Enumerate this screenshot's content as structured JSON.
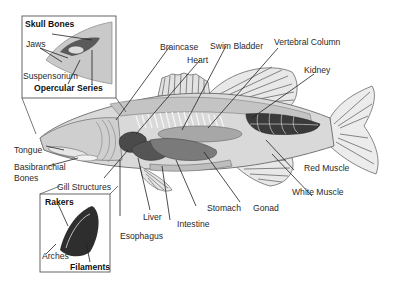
{
  "diagram": {
    "labels": {
      "skull_bones": "Skull Bones",
      "jaws": "Jaws",
      "suspensorium": "Suspensorium",
      "opercular_series": "Opercular Series",
      "braincase": "Braincase",
      "heart": "Heart",
      "swim_bladder": "Swim Bladder",
      "vertebral_column": "Vertebral Column",
      "kidney": "Kidney",
      "tongue": "Tongue",
      "basibranchial_1": "Basibranchial",
      "basibranchial_2": "Bones",
      "gill_structures": "Gill Structures",
      "rakers": "Rakers",
      "arches": "Arches",
      "filaments": "Filaments",
      "liver": "Liver",
      "esophagus": "Esophagus",
      "intestine": "Intestine",
      "stomach": "Stomach",
      "gonad": "Gonad",
      "red_muscle": "Red Muscle",
      "white_muscle": "White Muscle"
    },
    "insets": [
      "skull-inset",
      "gill-inset"
    ],
    "colors": {
      "body_light": "#d9d9d9",
      "body_mid": "#bdbdbd",
      "organ_dark": "#5a5a5a",
      "red_muscle": "#3a3a3a",
      "outline": "#6a6a6a",
      "leader": "#222222"
    }
  }
}
